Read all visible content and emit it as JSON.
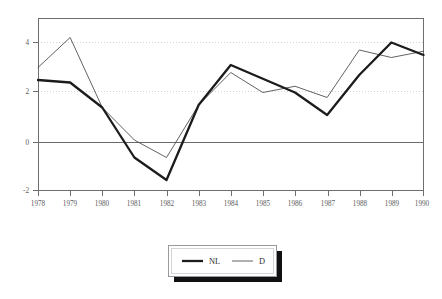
{
  "chart_data": {
    "type": "line",
    "title": "",
    "subtitle": "",
    "xlabel": "",
    "ylabel": "",
    "categories": [
      "1978",
      "1979",
      "1980",
      "1981",
      "1982",
      "1983",
      "1984",
      "1985",
      "1986",
      "1987",
      "1988",
      "1989",
      "1990"
    ],
    "x": [
      1978,
      1979,
      1980,
      1981,
      1982,
      1983,
      1984,
      1985,
      1986,
      1987,
      1988,
      1989,
      1990
    ],
    "xlim": [
      1978,
      1990
    ],
    "ylim": [
      -2,
      4.8
    ],
    "yticks": [
      4,
      2,
      0,
      -2
    ],
    "ytick_labels": [
      "4",
      "2",
      "0",
      "-2"
    ],
    "xtick_labels": [
      "1978",
      "1979",
      "1980",
      "1981",
      "1982",
      "1983",
      "1984",
      "1985",
      "1986",
      "1987",
      "1988",
      "1989",
      "1990"
    ],
    "grid": "horizontal-dotted-at-2-and-4-solid-at-0",
    "legend_position": "below-center",
    "series": [
      {
        "name": "NL",
        "style": "thick-solid",
        "color": "#1c1c1c",
        "values": [
          2.5,
          2.4,
          1.4,
          -0.6,
          -1.5,
          1.5,
          3.1,
          2.55,
          2.0,
          1.1,
          2.7,
          4.0,
          3.5
        ]
      },
      {
        "name": "D",
        "style": "thin-solid",
        "color": "#46464a",
        "values": [
          3.0,
          4.2,
          1.4,
          0.1,
          -0.6,
          1.5,
          2.8,
          2.0,
          2.25,
          1.8,
          3.7,
          3.4,
          3.65
        ]
      }
    ]
  },
  "legend": {
    "entries": [
      {
        "label": "NL",
        "marker": "thick-line-swatch"
      },
      {
        "label": "D",
        "marker": "thin-line-swatch"
      }
    ]
  },
  "axes": {
    "y_tick_labels": [
      "4",
      "2",
      "0",
      "-2"
    ],
    "x_tick_labels": [
      "1978",
      "1979",
      "1980",
      "1981",
      "1982",
      "1983",
      "1984",
      "1985",
      "1986",
      "1987",
      "1988",
      "1989",
      "1990"
    ]
  },
  "colors": {
    "background": "#ffffff",
    "frame": "#6e6e72",
    "gridline": "#c9c9cc",
    "zero_line": "#6a6a6e",
    "series_nl": "#1c1c1c",
    "series_d": "#46464a",
    "text": "#55555a",
    "legend_shadow": "#111114"
  }
}
